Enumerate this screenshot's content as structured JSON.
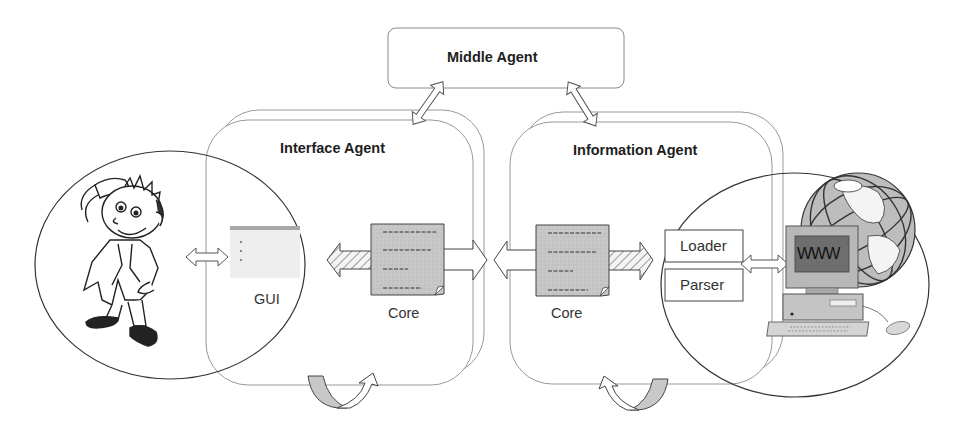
{
  "diagram": {
    "middle_agent": {
      "label": "Middle Agent"
    },
    "interface_agent": {
      "label": "Interface Agent",
      "gui_label": "GUI",
      "core_label": "Core"
    },
    "information_agent": {
      "label": "Information Agent",
      "core_label": "Core",
      "modules": [
        {
          "label": "Loader"
        },
        {
          "label": "Parser"
        }
      ]
    },
    "www": {
      "screen_text": "WWW"
    },
    "icons": {
      "user": "cartoon-user-icon",
      "globe": "globe-icon",
      "computer": "computer-icon",
      "document": "document-icon",
      "cycle_arrow": "cycle-arrow-icon"
    },
    "colors": {
      "line": "#8a8a8a",
      "ellipse": "#333333",
      "doc_fill": "#c8c8c8",
      "gui_bar": "#a8a8a8",
      "gui_fill": "#eeeeee",
      "screen": "#6e6e6e"
    }
  }
}
